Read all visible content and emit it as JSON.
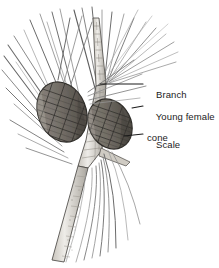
{
  "figure": {
    "background_color": "#ffffff",
    "width": 219,
    "height": 268
  },
  "palette": {
    "background": "#ffffff",
    "ink": "#1b1b1b",
    "needle_dark": "#5d5d5d",
    "needle_light": "#9a9a9a",
    "stem_fill": "#e4e2de",
    "stem_outline": "#4a4844",
    "stem_shade": "#b3afa8",
    "cone_fill": "#7c7770",
    "cone_shade": "#5c5750",
    "cone_highlight": "#9c978f",
    "cone_outline": "#32302c",
    "leader_line": "#1b1b1b"
  },
  "labels": [
    {
      "id": "branch",
      "text": "Branch",
      "line2": "",
      "leader": {
        "x1": 100,
        "y1": 84,
        "x2": 143,
        "y2": 84
      }
    },
    {
      "id": "young-female-cone",
      "text": "Young female",
      "line2": "cone",
      "leader": {
        "x1": 132,
        "y1": 108,
        "x2": 143,
        "y2": 106
      }
    },
    {
      "id": "scale",
      "text": "Scale",
      "line2": "",
      "leader": {
        "x1": 124,
        "y1": 136,
        "x2": 143,
        "y2": 134
      }
    }
  ],
  "structures": {
    "cones": [
      {
        "id": "cone-left",
        "label": "Young female cone (left)",
        "cx": 62,
        "cy": 112,
        "rx": 24,
        "ry": 31,
        "rotation": -22
      },
      {
        "id": "cone-right",
        "label": "Young female cone (right)",
        "cx": 110,
        "cy": 124,
        "rx": 21,
        "ry": 26,
        "rotation": -28
      }
    ],
    "stems": [
      {
        "id": "stem-upper",
        "label": "Upper branch axis"
      },
      {
        "id": "stem-main",
        "label": "Main branch axis"
      },
      {
        "id": "stem-lower",
        "label": "Lower branch axis"
      }
    ],
    "needle_clusters": [
      {
        "id": "needles-upper-right",
        "label": "Upper right needle fascicle"
      },
      {
        "id": "needles-upper-left",
        "label": "Upper left needle fascicle"
      },
      {
        "id": "needles-left",
        "label": "Left needle fascicle"
      },
      {
        "id": "needles-lower",
        "label": "Lower needle fascicle"
      }
    ]
  }
}
